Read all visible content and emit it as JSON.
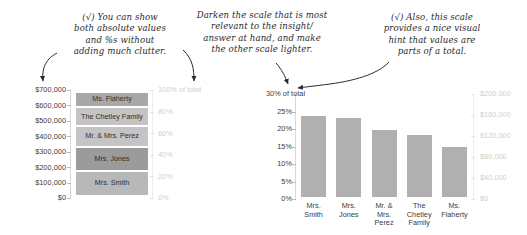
{
  "annotations": {
    "left": "(√) You can show\nboth absolute values\nand %s without\nadding much clutter.",
    "middle": "Darken the scale that is most\nrelevant to the insight/\nanswer at hand, and make\nthe other scale lighter.",
    "right": "(√) Also, this scale\nprovides a nice visual\nhint that values are\nparts of a total."
  },
  "colors": {
    "annotation_text": "#2b2b2b",
    "dark_axis_text": "#3d3d3d",
    "light_axis_text": "#cfcfcf",
    "bar_gray": "#b0b0b0",
    "arrow": "#2b2b2b"
  },
  "chart_data": [
    {
      "type": "bar",
      "id": "stacked-donor-chart",
      "orientation": "vertical-stacked",
      "title": "",
      "categories": [
        "Mrs. Smith",
        "Mrs. Jones",
        "Mr. & Mrs. Perez",
        "The Chetley Family",
        "Ms. Flaherty"
      ],
      "values": [
        168000,
        164000,
        138000,
        129000,
        103000
      ],
      "percent_values": [
        24,
        23.5,
        20,
        18.5,
        15
      ],
      "segment_colors": [
        "#b8b8b8",
        "#9b9b9b",
        "#c4c4c4",
        "#c4c4c4",
        "#a8a8a8"
      ],
      "left_axis": {
        "label": "",
        "ticks": [
          "$0",
          "$100,000",
          "$200,000",
          "$300,000",
          "$400,000",
          "$500,000",
          "$600,000",
          "$700,000"
        ],
        "min": 0,
        "max": 700000,
        "emphasis": "dark"
      },
      "right_axis": {
        "label": "100% of total",
        "ticks": [
          "0%",
          "20%",
          "40%",
          "60%",
          "80%",
          "100% of total"
        ],
        "min": 0,
        "max": 100,
        "emphasis": "light"
      },
      "grid": false,
      "legend": "none"
    },
    {
      "type": "bar",
      "id": "percent-donor-chart",
      "orientation": "vertical",
      "title": "",
      "categories": [
        "Mrs.\nSmith",
        "Mrs.\nJones",
        "Mr. &\nMrs.\nPerez",
        "The\nChetley\nFamily",
        "Ms.\nFlaherty"
      ],
      "values": [
        24,
        23.5,
        20,
        18.5,
        15
      ],
      "dollar_values": [
        168000,
        164000,
        138000,
        129000,
        103000
      ],
      "left_axis": {
        "label": "30% of total",
        "ticks": [
          "0%",
          "5%",
          "10%",
          "15%",
          "20%",
          "25%",
          "30% of total"
        ],
        "min": 0,
        "max": 30,
        "emphasis": "dark"
      },
      "right_axis": {
        "label": "",
        "ticks": [
          "$0",
          "$40,000",
          "$80,000",
          "$120,000",
          "$160,000",
          "$200,000"
        ],
        "min": 0,
        "max": 200000,
        "emphasis": "light"
      },
      "grid": false,
      "legend": "none"
    }
  ],
  "left_chart": {
    "left_ticks": [
      {
        "label": "$700,000",
        "pct": 100
      },
      {
        "label": "$600,000",
        "pct": 85.714
      },
      {
        "label": "$500,000",
        "pct": 71.428
      },
      {
        "label": "$400,000",
        "pct": 57.142
      },
      {
        "label": "$300,000",
        "pct": 42.857
      },
      {
        "label": "$200,000",
        "pct": 28.571
      },
      {
        "label": "$100,000",
        "pct": 14.285
      },
      {
        "label": "$0",
        "pct": 0
      }
    ],
    "right_ticks": [
      {
        "label": "100% of total",
        "pct": 100
      },
      {
        "label": "80%",
        "pct": 80
      },
      {
        "label": "60%",
        "pct": 60
      },
      {
        "label": "40%",
        "pct": 40
      },
      {
        "label": "20%",
        "pct": 20
      },
      {
        "label": "0%",
        "pct": 0
      }
    ],
    "segments": [
      {
        "name": "Ms. Flaherty",
        "height_pct": 14.7,
        "color": "#a8a8a8"
      },
      {
        "name": "The Chetley\nFamily",
        "height_pct": 18.4,
        "color": "#c4c4c4"
      },
      {
        "name": "Mr. & Mrs.\nPerez",
        "height_pct": 19.7,
        "color": "#c4c4c4"
      },
      {
        "name": "Mrs. Jones",
        "height_pct": 23.4,
        "color": "#9b9b9b"
      },
      {
        "name": "Mrs. Smith",
        "height_pct": 23.8,
        "color": "#b8b8b8"
      }
    ]
  },
  "right_chart": {
    "left_ticks": [
      {
        "label": "30% of total",
        "pct": 100
      },
      {
        "label": "25%",
        "pct": 83.333
      },
      {
        "label": "20%",
        "pct": 66.666
      },
      {
        "label": "15%",
        "pct": 50
      },
      {
        "label": "10%",
        "pct": 33.333
      },
      {
        "label": "5%",
        "pct": 16.666
      },
      {
        "label": "0%",
        "pct": 0
      }
    ],
    "right_ticks": [
      {
        "label": "$200,000",
        "pct": 100
      },
      {
        "label": "$160,000",
        "pct": 80
      },
      {
        "label": "$120,000",
        "pct": 60
      },
      {
        "label": "$80,000",
        "pct": 40
      },
      {
        "label": "$40,000",
        "pct": 20
      },
      {
        "label": "$0",
        "pct": 0
      }
    ],
    "bars": [
      {
        "name": "Mrs.\nSmith",
        "height_pct": 80.5
      },
      {
        "name": "Mrs.\nJones",
        "height_pct": 78.3
      },
      {
        "name": "Mr. &\nMrs.\nPerez",
        "height_pct": 66.5
      },
      {
        "name": "The\nChetley\nFamily",
        "height_pct": 61.5
      },
      {
        "name": "Ms.\nFlaherty",
        "height_pct": 49.5
      }
    ]
  }
}
